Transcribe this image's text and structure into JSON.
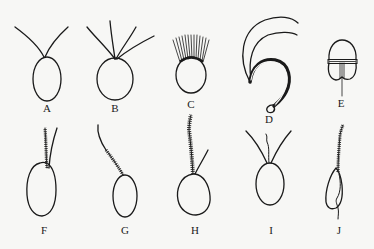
{
  "figure": {
    "panels": [
      {
        "label": "A",
        "description": "oval cell with two smooth flagella diverging from apex"
      },
      {
        "label": "B",
        "description": "oval cell with four smooth flagella from apex"
      },
      {
        "label": "C",
        "description": "cell with a crown of many flagella at apex"
      },
      {
        "label": "D",
        "description": "curved hook-shaped cell with two long flagella, coiled at tip"
      },
      {
        "label": "E",
        "description": "cell with transverse girdle groove and trailing flagellum"
      },
      {
        "label": "F",
        "description": "oval cell with two flagella, one hairy (tinsel)"
      },
      {
        "label": "G",
        "description": "oval cell with single hairy flagellum"
      },
      {
        "label": "H",
        "description": "rounded cell with one long hairy flagellum and one smooth flagellum"
      },
      {
        "label": "I",
        "description": "oval cell with two smooth flagella and a short middle one"
      },
      {
        "label": "J",
        "description": "elongate cell with a forward hairy flagellum and trailing smooth flagellum"
      }
    ]
  }
}
